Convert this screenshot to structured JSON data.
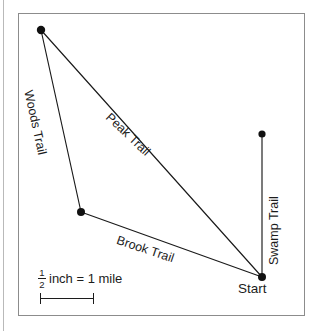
{
  "diagram": {
    "type": "trail-map",
    "frame": {
      "x": 18,
      "y": 13,
      "width": 287,
      "height": 303
    },
    "nodes": [
      {
        "name": "peak-vertex",
        "label": "",
        "x": 41,
        "y": 30
      },
      {
        "name": "junction-vertex",
        "label": "",
        "x": 81,
        "y": 212
      },
      {
        "name": "start-vertex",
        "label": "Start",
        "x": 262,
        "y": 277
      },
      {
        "name": "swamp-end-vertex",
        "label": "",
        "x": 262,
        "y": 134
      }
    ],
    "trails": [
      {
        "name": "woods-trail",
        "label": "Woods Trail",
        "from": "peak-vertex",
        "to": "junction-vertex"
      },
      {
        "name": "peak-trail",
        "label": "Peak Trail",
        "from": "peak-vertex",
        "to": "start-vertex"
      },
      {
        "name": "brook-trail",
        "label": "Brook Trail",
        "from": "junction-vertex",
        "to": "start-vertex"
      },
      {
        "name": "swamp-trail",
        "label": "Swamp Trail",
        "from": "start-vertex",
        "to": "swamp-end-vertex"
      }
    ],
    "labels": {
      "woods": "Woods Trail",
      "peak": "Peak Trail",
      "brook": "Brook Trail",
      "swamp": "Swamp Trail",
      "start": "Start"
    },
    "scale": {
      "numerator": "1",
      "denominator": "2",
      "units_text": "inch = 1 mile",
      "bar_length_px": 54
    },
    "colors": {
      "line": "#1a1a1a",
      "dot": "#111111",
      "frame_border": "#8c8c8c",
      "background": "#ffffff",
      "text": "#1c1c1c",
      "margin_rule": "#b9b9b9"
    }
  }
}
